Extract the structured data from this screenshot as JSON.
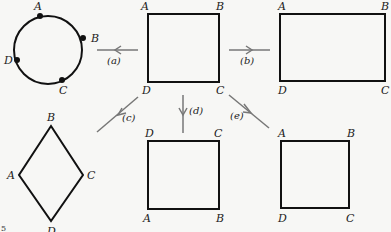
{
  "figure": {
    "number": "5",
    "colors": {
      "stroke": "#111111",
      "arrow": "#777777",
      "background": "#f7f7f5",
      "text": "#222222"
    }
  },
  "shapes": {
    "source_square": {
      "labels": {
        "tl": "A",
        "tr": "B",
        "bl": "D",
        "br": "C"
      }
    },
    "circle": {
      "labels": {
        "a": "A",
        "b": "B",
        "c": "C",
        "d": "D"
      }
    },
    "rectangle": {
      "labels": {
        "tl": "A",
        "tr": "B",
        "bl": "D",
        "br": "C"
      }
    },
    "rhombus": {
      "labels": {
        "top": "B",
        "left": "A",
        "right": "C",
        "bottom": "D"
      }
    },
    "flipped_square": {
      "labels": {
        "tl": "D",
        "tr": "C",
        "bl": "A",
        "br": "B"
      }
    },
    "same_square": {
      "labels": {
        "tl": "A",
        "tr": "B",
        "bl": "D",
        "br": "C"
      }
    }
  },
  "arrows": {
    "a": {
      "label": "(a)"
    },
    "b": {
      "label": "(b)"
    },
    "c": {
      "label": "(c)"
    },
    "d": {
      "label": "(d)"
    },
    "e": {
      "label": "(e)"
    }
  }
}
